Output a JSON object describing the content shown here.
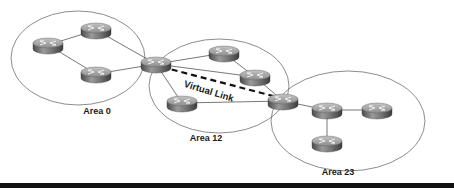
{
  "diagram": {
    "type": "ospf-virtual-link",
    "colors": {
      "ellipse_stroke": "#6f6f6f",
      "link_stroke": "#555555",
      "virtual_link_stroke": "#111111",
      "router_top": "#9a9a9a",
      "router_side": "#5c5c5c",
      "bottom_bar": "#111111"
    },
    "areas": [
      {
        "id": "area0",
        "label": "Area 0",
        "cx": 78,
        "cy": 58,
        "rx": 67,
        "ry": 47,
        "label_x": 97,
        "label_y": 106
      },
      {
        "id": "area12",
        "label": "Area 12",
        "cx": 219,
        "cy": 86,
        "rx": 70,
        "ry": 47,
        "label_x": 206,
        "label_y": 133
      },
      {
        "id": "area23",
        "label": "Area 23",
        "cx": 348,
        "cy": 121,
        "rx": 77,
        "ry": 50,
        "label_x": 338,
        "label_y": 167
      }
    ],
    "routers": [
      {
        "id": "r0a",
        "area": "Area 0",
        "x": 48,
        "y": 45
      },
      {
        "id": "r0b",
        "area": "Area 0",
        "x": 96,
        "y": 30
      },
      {
        "id": "r0c",
        "area": "Area 0",
        "x": 96,
        "y": 74
      },
      {
        "id": "abr1",
        "area": "Area 0 / Area 12",
        "x": 156,
        "y": 64
      },
      {
        "id": "r12a",
        "area": "Area 12",
        "x": 224,
        "y": 53
      },
      {
        "id": "r12b",
        "area": "Area 12",
        "x": 255,
        "y": 77
      },
      {
        "id": "r12c",
        "area": "Area 12",
        "x": 182,
        "y": 103
      },
      {
        "id": "abr2",
        "area": "Area 12 / Area 23",
        "x": 283,
        "y": 101
      },
      {
        "id": "r23a",
        "area": "Area 23",
        "x": 327,
        "y": 110
      },
      {
        "id": "r23b",
        "area": "Area 23",
        "x": 377,
        "y": 110
      },
      {
        "id": "r23c",
        "area": "Area 23",
        "x": 327,
        "y": 143
      }
    ],
    "links": [
      [
        "r0a",
        "r0b"
      ],
      [
        "r0a",
        "r0c"
      ],
      [
        "r0b",
        "abr1"
      ],
      [
        "r0c",
        "abr1"
      ],
      [
        "abr1",
        "r12a"
      ],
      [
        "abr1",
        "r12b"
      ],
      [
        "abr1",
        "r12c"
      ],
      [
        "r12a",
        "r12b"
      ],
      [
        "r12b",
        "abr2"
      ],
      [
        "r12c",
        "abr2"
      ],
      [
        "abr2",
        "r23a"
      ],
      [
        "r23a",
        "r23b"
      ],
      [
        "r23a",
        "r23c"
      ]
    ],
    "virtual_link": {
      "label": "Virtual Link",
      "from": "abr1",
      "to": "abr2",
      "label_x": 186,
      "label_y": 78,
      "label_angle": 17
    }
  }
}
